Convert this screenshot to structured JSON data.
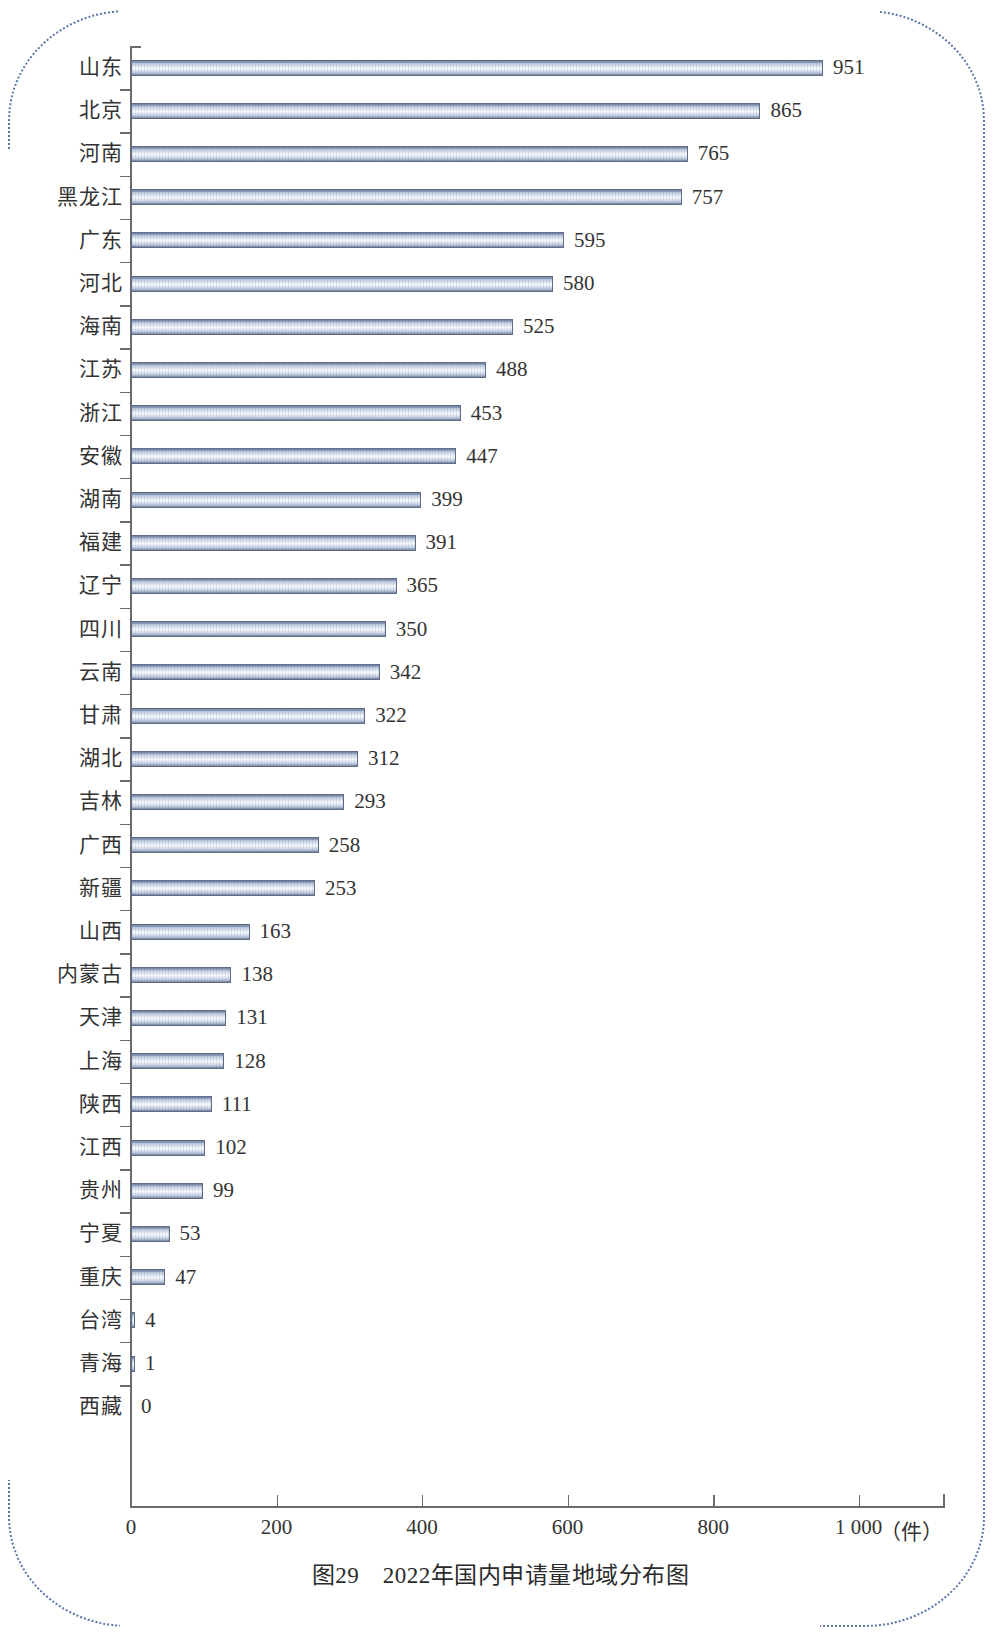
{
  "caption": "图29　2022年国内申请量地域分布图",
  "x_unit_label": "（件）",
  "axis": {
    "tick_labels": [
      "0",
      "200",
      "400",
      "600",
      "800",
      "1 000"
    ]
  },
  "chart_data": {
    "type": "bar",
    "orientation": "horizontal",
    "title": "图29　2022年国内申请量地域分布图",
    "xlabel": "（件）",
    "ylabel": "",
    "xlim": [
      0,
      1000
    ],
    "grid": false,
    "legend": null,
    "categories": [
      "山东",
      "北京",
      "河南",
      "黑龙江",
      "广东",
      "河北",
      "海南",
      "江苏",
      "浙江",
      "安徽",
      "湖南",
      "福建",
      "辽宁",
      "四川",
      "云南",
      "甘肃",
      "湖北",
      "吉林",
      "广西",
      "新疆",
      "山西",
      "内蒙古",
      "天津",
      "上海",
      "陕西",
      "江西",
      "贵州",
      "宁夏",
      "重庆",
      "台湾",
      "青海",
      "西藏"
    ],
    "values": [
      951,
      865,
      765,
      757,
      595,
      580,
      525,
      488,
      453,
      447,
      399,
      391,
      365,
      350,
      342,
      322,
      312,
      293,
      258,
      253,
      163,
      138,
      131,
      128,
      111,
      102,
      99,
      53,
      47,
      4,
      1,
      0
    ],
    "xticks": [
      0,
      200,
      400,
      600,
      800,
      1000
    ],
    "xtick_labels": [
      "0",
      "200",
      "400",
      "600",
      "800",
      "1 000"
    ]
  },
  "colors": {
    "bar_border": "#5e6c87",
    "bar_light": "#fbfcfe",
    "bar_mid": "#b9c5da",
    "bar_dark": "#6b7a96",
    "axis": "#6b6b6b",
    "text": "#333333",
    "frame_dotted": "#5b78a8"
  }
}
